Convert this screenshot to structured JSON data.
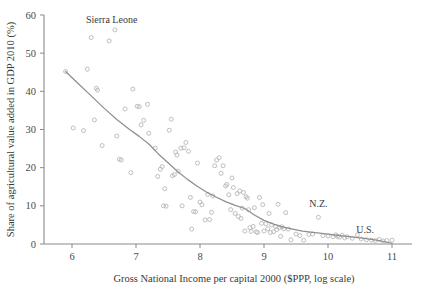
{
  "chart_data": {
    "type": "scatter",
    "title": "",
    "xlabel": "Gross National Income per capital 2000 ($PPP, log scale)",
    "ylabel": "Share of agricultural value added in GDP 2010 (%)",
    "xlim": [
      5.55,
      11.35
    ],
    "ylim": [
      0,
      60
    ],
    "xticks": [
      6,
      7,
      8,
      9,
      10,
      11
    ],
    "xtick_labels": [
      "6",
      "7",
      "8",
      "9",
      "10",
      "11"
    ],
    "yticks": [
      0,
      10,
      20,
      30,
      40,
      50,
      60
    ],
    "ytick_labels": [
      "0",
      "10",
      "20",
      "30",
      "40",
      "50",
      "60"
    ],
    "grid": false,
    "legend": null,
    "marker_style": "open-circle",
    "marker_color": "#b4b4b4",
    "trend_line_color": "#8f8f8f",
    "axis_color": "#8a8a8a",
    "annotations": [
      {
        "text": "Sierra Leone",
        "x": 6.62,
        "y": 58.0
      },
      {
        "text": "N.Z.",
        "x": 9.85,
        "y": 9.6
      },
      {
        "text": "U.S.",
        "x": 10.58,
        "y": 2.9
      }
    ],
    "series": [
      {
        "name": "Countries",
        "points": [
          [
            5.9,
            45.2
          ],
          [
            6.02,
            30.4
          ],
          [
            6.18,
            29.7
          ],
          [
            6.24,
            45.8
          ],
          [
            6.3,
            54.1
          ],
          [
            6.35,
            32.5
          ],
          [
            6.38,
            40.8
          ],
          [
            6.4,
            40.3
          ],
          [
            6.47,
            25.8
          ],
          [
            6.58,
            53.2
          ],
          [
            6.67,
            56.1
          ],
          [
            6.7,
            28.3
          ],
          [
            6.74,
            22.2
          ],
          [
            6.77,
            22.0
          ],
          [
            6.83,
            35.4
          ],
          [
            6.92,
            18.7
          ],
          [
            6.95,
            40.6
          ],
          [
            7.02,
            36.1
          ],
          [
            7.05,
            36.0
          ],
          [
            7.08,
            31.2
          ],
          [
            7.12,
            32.4
          ],
          [
            7.18,
            36.6
          ],
          [
            7.2,
            29.0
          ],
          [
            7.3,
            25.1
          ],
          [
            7.34,
            17.7
          ],
          [
            7.38,
            19.6
          ],
          [
            7.41,
            20.3
          ],
          [
            7.43,
            10.0
          ],
          [
            7.45,
            14.5
          ],
          [
            7.47,
            9.9
          ],
          [
            7.52,
            29.8
          ],
          [
            7.55,
            32.7
          ],
          [
            7.57,
            17.9
          ],
          [
            7.6,
            18.2
          ],
          [
            7.62,
            24.1
          ],
          [
            7.64,
            23.3
          ],
          [
            7.66,
            19.1
          ],
          [
            7.7,
            25.1
          ],
          [
            7.72,
            10.0
          ],
          [
            7.75,
            25.2
          ],
          [
            7.78,
            26.6
          ],
          [
            7.82,
            24.3
          ],
          [
            7.85,
            12.2
          ],
          [
            7.87,
            3.9
          ],
          [
            7.9,
            8.5
          ],
          [
            7.93,
            8.4
          ],
          [
            7.96,
            21.2
          ],
          [
            8.0,
            11.0
          ],
          [
            8.03,
            10.3
          ],
          [
            8.08,
            6.3
          ],
          [
            8.12,
            13.0
          ],
          [
            8.15,
            6.4
          ],
          [
            8.18,
            8.3
          ],
          [
            8.2,
            12.6
          ],
          [
            8.23,
            20.5
          ],
          [
            8.26,
            22.0
          ],
          [
            8.3,
            22.6
          ],
          [
            8.33,
            18.5
          ],
          [
            8.36,
            20.5
          ],
          [
            8.4,
            15.2
          ],
          [
            8.42,
            15.6
          ],
          [
            8.45,
            12.9
          ],
          [
            8.48,
            9.0
          ],
          [
            8.5,
            17.3
          ],
          [
            8.52,
            14.8
          ],
          [
            8.55,
            8.0
          ],
          [
            8.58,
            13.2
          ],
          [
            8.6,
            7.2
          ],
          [
            8.62,
            13.9
          ],
          [
            8.64,
            6.7
          ],
          [
            8.66,
            9.4
          ],
          [
            8.68,
            13.5
          ],
          [
            8.7,
            3.4
          ],
          [
            8.72,
            12.4
          ],
          [
            8.74,
            12.0
          ],
          [
            8.76,
            9.0
          ],
          [
            8.78,
            4.3
          ],
          [
            8.8,
            3.3
          ],
          [
            8.83,
            4.6
          ],
          [
            8.85,
            9.5
          ],
          [
            8.88,
            3.2
          ],
          [
            8.9,
            3.0
          ],
          [
            8.93,
            12.2
          ],
          [
            8.96,
            5.4
          ],
          [
            8.98,
            10.3
          ],
          [
            9.0,
            3.4
          ],
          [
            9.03,
            5.3
          ],
          [
            9.06,
            4.0
          ],
          [
            9.08,
            8.0
          ],
          [
            9.1,
            3.0
          ],
          [
            9.12,
            5.0
          ],
          [
            9.15,
            3.2
          ],
          [
            9.18,
            4.6
          ],
          [
            9.2,
            3.8
          ],
          [
            9.22,
            10.4
          ],
          [
            9.24,
            4.3
          ],
          [
            9.26,
            2.0
          ],
          [
            9.28,
            4.5
          ],
          [
            9.31,
            4.0
          ],
          [
            9.34,
            8.2
          ],
          [
            9.38,
            3.9
          ],
          [
            9.42,
            1.1
          ],
          [
            9.5,
            2.6
          ],
          [
            9.56,
            2.2
          ],
          [
            9.62,
            1.0
          ],
          [
            9.7,
            2.5
          ],
          [
            9.76,
            2.6
          ],
          [
            9.85,
            7.0
          ],
          [
            9.92,
            2.2
          ],
          [
            10.0,
            2.1
          ],
          [
            10.08,
            1.9
          ],
          [
            10.12,
            2.4
          ],
          [
            10.15,
            2.0
          ],
          [
            10.18,
            1.8
          ],
          [
            10.22,
            2.3
          ],
          [
            10.26,
            1.6
          ],
          [
            10.3,
            1.9
          ],
          [
            10.38,
            1.5
          ],
          [
            10.46,
            2.4
          ],
          [
            10.52,
            1.3
          ],
          [
            10.6,
            1.1
          ],
          [
            10.68,
            1.0
          ],
          [
            10.74,
            0.9
          ],
          [
            10.8,
            1.2
          ],
          [
            10.86,
            0.8
          ],
          [
            10.92,
            0.9
          ],
          [
            11.0,
            1.0
          ]
        ]
      }
    ],
    "trend_line": {
      "name": "LOWESS smoothed fit",
      "points": [
        [
          5.9,
          45.2
        ],
        [
          6.1,
          42.0
        ],
        [
          6.3,
          38.8
        ],
        [
          6.5,
          35.6
        ],
        [
          6.7,
          32.6
        ],
        [
          6.9,
          30.0
        ],
        [
          7.05,
          28.2
        ],
        [
          7.2,
          26.2
        ],
        [
          7.35,
          23.6
        ],
        [
          7.5,
          21.3
        ],
        [
          7.65,
          19.0
        ],
        [
          7.8,
          17.0
        ],
        [
          7.95,
          15.2
        ],
        [
          8.1,
          13.6
        ],
        [
          8.25,
          12.3
        ],
        [
          8.4,
          11.1
        ],
        [
          8.55,
          10.1
        ],
        [
          8.7,
          9.3
        ],
        [
          8.85,
          7.6
        ],
        [
          9.0,
          6.2
        ],
        [
          9.15,
          5.2
        ],
        [
          9.3,
          4.4
        ],
        [
          9.45,
          3.9
        ],
        [
          9.6,
          3.4
        ],
        [
          9.8,
          3.0
        ],
        [
          10.0,
          2.6
        ],
        [
          10.2,
          2.2
        ],
        [
          10.4,
          1.8
        ],
        [
          10.6,
          1.4
        ],
        [
          10.8,
          0.9
        ],
        [
          11.0,
          0.2
        ]
      ]
    }
  }
}
